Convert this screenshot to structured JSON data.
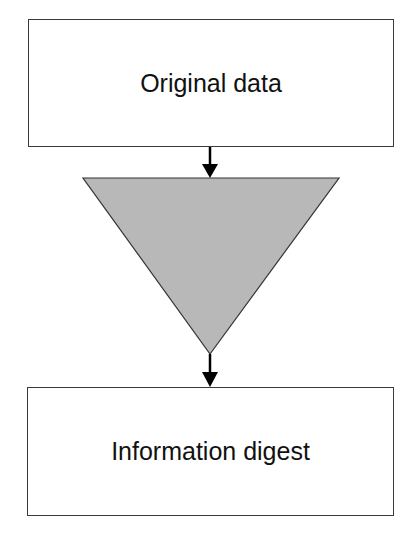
{
  "diagram": {
    "type": "flowchart",
    "nodes": [
      {
        "id": "original",
        "shape": "rectangle",
        "label": "Original data"
      },
      {
        "id": "filter",
        "shape": "inverted-triangle",
        "label": "",
        "fill": "#b8b8b8"
      },
      {
        "id": "digest",
        "shape": "rectangle",
        "label": "Information digest"
      }
    ],
    "edges": [
      {
        "from": "original",
        "to": "filter"
      },
      {
        "from": "filter",
        "to": "digest"
      }
    ]
  }
}
